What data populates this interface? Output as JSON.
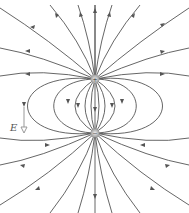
{
  "diagram": {
    "charges": [
      {
        "sign": "+",
        "label": "+",
        "x": 95,
        "y": 79
      },
      {
        "sign": "-",
        "label": "−",
        "x": 95,
        "y": 133
      }
    ],
    "field_vector_label": "E",
    "colors": {
      "line": "#555555",
      "charge": "#888888",
      "vector": "#999999"
    }
  }
}
